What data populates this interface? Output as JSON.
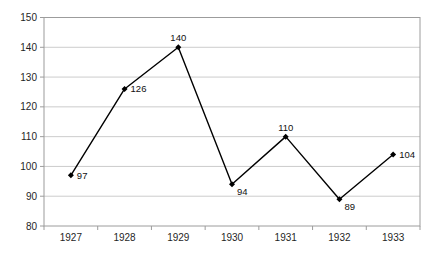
{
  "chart_data": {
    "type": "line",
    "title": "",
    "xlabel": "",
    "ylabel": "",
    "categories": [
      "1927",
      "1928",
      "1929",
      "1930",
      "1931",
      "1932",
      "1933"
    ],
    "series": [
      {
        "name": "",
        "values": [
          97,
          126,
          140,
          94,
          110,
          89,
          104
        ]
      }
    ],
    "data_labels": [
      "97",
      "126",
      "140",
      "94",
      "110",
      "89",
      "104"
    ],
    "label_positions": [
      "right",
      "right",
      "above",
      "below-right",
      "above",
      "below-right",
      "right"
    ],
    "ylim": [
      80,
      150
    ],
    "ytick_step": 10,
    "ytick_labels": [
      "80",
      "90",
      "100",
      "110",
      "120",
      "130",
      "140",
      "150"
    ],
    "grid": true,
    "legend_position": "none",
    "marker": "diamond",
    "colors": {
      "line": "#000000",
      "marker": "#000000",
      "gridline": "#cccccc",
      "plot_border": "#9c9c9c",
      "axis_text": "#1f1f1f",
      "label_text": "#111111",
      "background": "#ffffff"
    }
  }
}
